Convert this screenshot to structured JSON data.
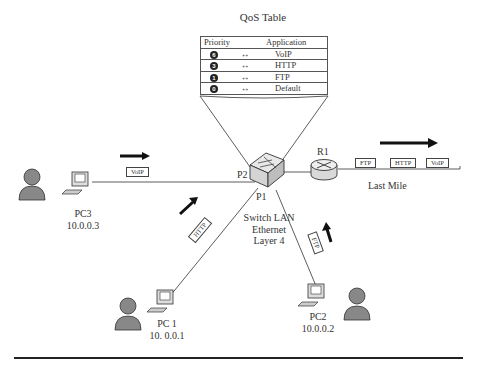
{
  "qos_table": {
    "title": "QoS Table",
    "headers": {
      "priority": "Priority",
      "application": "Application"
    },
    "rows": [
      {
        "priority": "6",
        "arrow": "↔",
        "application": "VoIP"
      },
      {
        "priority": "3",
        "arrow": "↔",
        "application": "HTTP"
      },
      {
        "priority": "1",
        "arrow": "↔",
        "application": "FTP"
      },
      {
        "priority": "0",
        "arrow": "↔",
        "application": "Default"
      }
    ]
  },
  "switch": {
    "label_lines": [
      "Switch LAN",
      "Ethernet",
      "Layer 4"
    ],
    "ports": {
      "p1": "P1",
      "p2": "P2"
    }
  },
  "router": {
    "label": "R1"
  },
  "last_mile": {
    "label": "Last Mile",
    "packets": [
      "FTP",
      "HTTP",
      "VoIP"
    ]
  },
  "hosts": [
    {
      "name": "PC3",
      "ip": "10.0.0.3",
      "packet": "VoIP"
    },
    {
      "name": "PC 1",
      "ip": "10. 0.0.1",
      "packet": "HTTP"
    },
    {
      "name": "PC2",
      "ip": "10.0.0.2",
      "packet": "FTP"
    }
  ]
}
